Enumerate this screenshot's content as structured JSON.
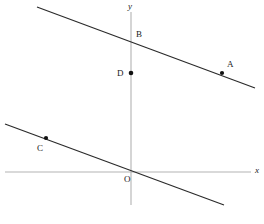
{
  "figure": {
    "type": "coordinate-geometry-diagram",
    "width": 264,
    "height": 224,
    "background_color": "#ffffff",
    "axis_color": "#b3b3b3",
    "line_color": "#2b2b2b",
    "point_color": "#111111",
    "text_color": "#1a1a1a"
  },
  "axes": {
    "x_axis": {
      "label": "x",
      "label_x": 255,
      "label_y": 166,
      "x1": 5,
      "y1": 172,
      "x2": 251,
      "y2": 172
    },
    "y_axis": {
      "label": "y",
      "label_x": 128,
      "label_y": 2,
      "x1": 131,
      "y1": 12,
      "x2": 131,
      "y2": 205
    },
    "origin": {
      "label": "O",
      "x": 131,
      "y": 172,
      "label_x": 124,
      "label_y": 175
    }
  },
  "lines": [
    {
      "name": "upper-line",
      "through_points": [
        "B",
        "A"
      ],
      "x1": 37,
      "y1": 7,
      "x2": 255,
      "y2": 88
    },
    {
      "name": "lower-line",
      "through_points": [
        "C",
        "O"
      ],
      "x1": 5,
      "y1": 124,
      "x2": 224,
      "y2": 205
    }
  ],
  "points": [
    {
      "label": "A",
      "x": 222,
      "y": 73,
      "label_x": 227,
      "label_y": 60,
      "dot": true
    },
    {
      "label": "B",
      "x": 131,
      "y": 39,
      "label_x": 136,
      "label_y": 30,
      "dot": false
    },
    {
      "label": "C",
      "x": 46,
      "y": 138,
      "label_x": 37,
      "label_y": 144,
      "dot": true
    },
    {
      "label": "D",
      "x": 131,
      "y": 73,
      "label_x": 117,
      "label_y": 69,
      "dot": true
    }
  ],
  "chart_data": {
    "type": "scatter",
    "title": "",
    "xlabel": "x",
    "ylabel": "y",
    "grid": false,
    "legend": null,
    "annotations": [
      "A",
      "B",
      "C",
      "D",
      "O"
    ]
  }
}
